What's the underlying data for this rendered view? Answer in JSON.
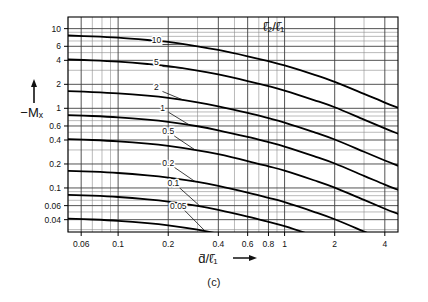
{
  "figure": {
    "caption": "(c)",
    "legend_label": "ℓ̄₂/ℓ̄₁",
    "ylabel": "−Mₓ",
    "ylabel_arrow": "↑",
    "xlabel": "d̄/ℓ̄₁",
    "xlabel_arrow": "⟶"
  },
  "chart_data": {
    "type": "line",
    "title": "",
    "subtitle": "",
    "xlabel": "d̄/ℓ̄₁",
    "ylabel": "−Mₓ",
    "xscale": "log",
    "yscale": "log",
    "xlim": [
      0.05,
      4.8
    ],
    "ylim": [
      0.028,
      14.0
    ],
    "grid": true,
    "legend_position": "top-right-inside",
    "legend_title": "ℓ̄₂/ℓ̄₁",
    "xticks": [
      0.06,
      0.1,
      0.2,
      0.4,
      0.6,
      0.8,
      1,
      2,
      4
    ],
    "xticklabels": [
      "0.06",
      "0.1",
      "0.2",
      "0.4",
      "0.6",
      "0.8",
      "1",
      "2",
      "4"
    ],
    "yticks": [
      10,
      6,
      4,
      2,
      1,
      0.6,
      0.4,
      0.2,
      0.1,
      0.06,
      0.04
    ],
    "yticklabels": [
      "10",
      "6",
      "4",
      "2",
      "1",
      "0.6",
      "0.4",
      "0.2",
      "0.1",
      "0.06",
      "0.04"
    ],
    "x_minor_gridlines": [
      0.05,
      0.06,
      0.07,
      0.08,
      0.09,
      0.1,
      0.2,
      0.3,
      0.4,
      0.5,
      0.6,
      0.7,
      0.8,
      0.9,
      1,
      2,
      3,
      4
    ],
    "y_minor_gridlines": [
      0.03,
      0.04,
      0.05,
      0.06,
      0.07,
      0.08,
      0.09,
      0.1,
      0.2,
      0.3,
      0.4,
      0.5,
      0.6,
      0.7,
      0.8,
      0.9,
      1,
      2,
      3,
      4,
      5,
      6,
      7,
      8,
      9,
      10
    ],
    "series": [
      {
        "name": "10",
        "label": "10",
        "label_x": 0.17,
        "label_y": 6.6,
        "x": [
          0.05,
          0.07,
          0.1,
          0.15,
          0.2,
          0.3,
          0.4,
          0.6,
          0.8,
          1.0,
          1.5,
          2.0,
          3.0,
          4.0,
          4.8
        ],
        "y": [
          8.2,
          8.0,
          7.7,
          7.2,
          6.8,
          6.0,
          5.4,
          4.5,
          3.9,
          3.45,
          2.65,
          2.15,
          1.52,
          1.18,
          1.02
        ]
      },
      {
        "name": "5",
        "label": "5",
        "label_x": 0.17,
        "label_y": 3.5,
        "x": [
          0.05,
          0.07,
          0.1,
          0.15,
          0.2,
          0.3,
          0.4,
          0.6,
          0.8,
          1.0,
          1.5,
          2.0,
          3.0,
          4.0,
          4.8
        ],
        "y": [
          4.1,
          4.0,
          3.85,
          3.6,
          3.38,
          2.98,
          2.66,
          2.2,
          1.9,
          1.67,
          1.27,
          1.03,
          0.72,
          0.56,
          0.48
        ]
      },
      {
        "name": "2",
        "label": "2",
        "label_x": 0.17,
        "label_y": 1.7,
        "x": [
          0.05,
          0.07,
          0.1,
          0.15,
          0.2,
          0.3,
          0.4,
          0.6,
          0.8,
          1.0,
          1.5,
          2.0,
          3.0,
          4.0,
          4.8
        ],
        "y": [
          1.64,
          1.6,
          1.54,
          1.44,
          1.35,
          1.19,
          1.06,
          0.875,
          0.752,
          0.663,
          0.503,
          0.406,
          0.285,
          0.221,
          0.19
        ]
      },
      {
        "name": "1",
        "label": "1",
        "label_x": 0.185,
        "label_y": 0.93,
        "x": [
          0.05,
          0.07,
          0.1,
          0.15,
          0.2,
          0.3,
          0.4,
          0.6,
          0.8,
          1.0,
          1.5,
          2.0,
          3.0,
          4.0,
          4.8
        ],
        "y": [
          0.82,
          0.8,
          0.77,
          0.72,
          0.675,
          0.595,
          0.53,
          0.437,
          0.375,
          0.331,
          0.251,
          0.203,
          0.142,
          0.11,
          0.095
        ]
      },
      {
        "name": "0.5",
        "label": "0.5",
        "label_x": 0.2,
        "label_y": 0.47,
        "x": [
          0.05,
          0.07,
          0.1,
          0.15,
          0.2,
          0.3,
          0.4,
          0.6,
          0.8,
          1.0,
          1.5,
          2.0,
          3.0,
          4.0,
          4.8
        ],
        "y": [
          0.41,
          0.4,
          0.385,
          0.36,
          0.337,
          0.297,
          0.265,
          0.218,
          0.187,
          0.165,
          0.125,
          0.101,
          0.0708,
          0.0549,
          0.0473
        ]
      },
      {
        "name": "0.2",
        "label": "0.2",
        "label_x": 0.2,
        "label_y": 0.19,
        "x": [
          0.05,
          0.07,
          0.1,
          0.15,
          0.2,
          0.3,
          0.4,
          0.6,
          0.8,
          1.0,
          1.5,
          2.0,
          3.0,
          4.0,
          4.8
        ],
        "y": [
          0.164,
          0.16,
          0.154,
          0.144,
          0.135,
          0.119,
          0.106,
          0.0874,
          0.0751,
          0.0662,
          0.0502,
          0.0405,
          0.0284,
          0.022,
          0.019
        ]
      },
      {
        "name": "0.1",
        "label": "0.1",
        "label_x": 0.215,
        "label_y": 0.105,
        "x": [
          0.05,
          0.07,
          0.1,
          0.15,
          0.2,
          0.3,
          0.4,
          0.6,
          0.8,
          1.0,
          1.5,
          2.0,
          3.0,
          4.0,
          4.8
        ],
        "y": [
          0.082,
          0.08,
          0.077,
          0.072,
          0.0675,
          0.0595,
          0.053,
          0.0437,
          0.0375,
          0.0331,
          0.0251,
          0.0203,
          0.0142,
          0.011,
          0.0095
        ]
      },
      {
        "name": "0.05",
        "label": "0.05",
        "label_x": 0.23,
        "label_y": 0.055,
        "x": [
          0.05,
          0.07,
          0.1,
          0.15,
          0.2,
          0.3,
          0.4,
          0.6,
          0.8,
          1.0,
          1.5,
          2.0,
          3.0,
          4.0,
          4.8
        ],
        "y": [
          0.0412,
          0.0402,
          0.0387,
          0.0362,
          0.0339,
          0.0299,
          0.0266,
          0.0219,
          0.0188,
          0.0166,
          0.0126,
          0.0102,
          0.00712,
          0.00552,
          0.00476
        ]
      }
    ]
  }
}
